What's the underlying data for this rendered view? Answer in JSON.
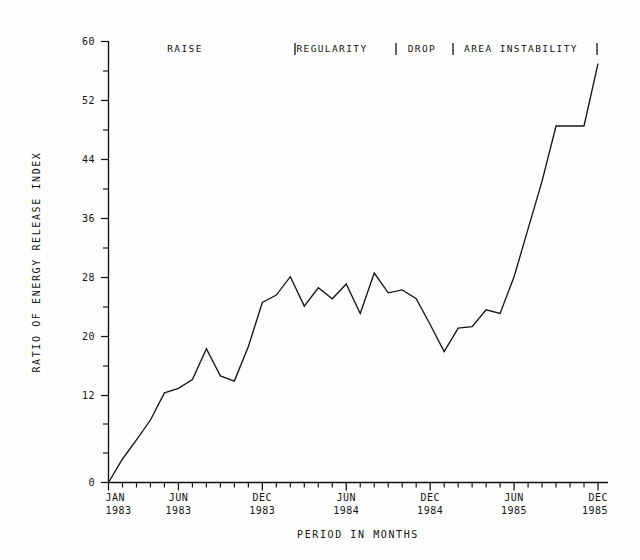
{
  "chart_data": {
    "type": "line",
    "title": "",
    "xlabel": "PERIOD IN MONTHS",
    "ylabel": "RATIO OF ENERGY RELEASE INDEX",
    "ylim": [
      0,
      60
    ],
    "y_major_ticks": [
      0,
      12,
      20,
      28,
      36,
      44,
      52,
      60
    ],
    "y_tick_labels": [
      "0",
      "12",
      "20",
      "28",
      "36",
      "44",
      "52",
      "60"
    ],
    "y_minor_ticks": [
      4,
      8,
      16,
      24,
      32,
      40,
      48,
      56
    ],
    "grid": false,
    "legend": "none",
    "x_tick_labels": [
      {
        "month": "JAN",
        "year": "1983",
        "index": 0
      },
      {
        "month": "JUN",
        "year": "1983",
        "index": 5
      },
      {
        "month": "DEC",
        "year": "1983",
        "index": 11
      },
      {
        "month": "JUN",
        "year": "1984",
        "index": 17
      },
      {
        "month": "DEC",
        "year": "1984",
        "index": 23
      },
      {
        "month": "JUN",
        "year": "1985",
        "index": 29
      },
      {
        "month": "DEC",
        "year": "1985",
        "index": 35
      }
    ],
    "x": [
      "JAN 1983",
      "FEB 1983",
      "MAR 1983",
      "APR 1983",
      "MAY 1983",
      "JUN 1983",
      "JUL 1983",
      "AUG 1983",
      "SEP 1983",
      "OCT 1983",
      "NOV 1983",
      "DEC 1983",
      "JAN 1984",
      "FEB 1984",
      "MAR 1984",
      "APR 1984",
      "MAY 1984",
      "JUN 1984",
      "JUL 1984",
      "AUG 1984",
      "SEP 1984",
      "OCT 1984",
      "NOV 1984",
      "DEC 1984",
      "JAN 1985",
      "FEB 1985",
      "MAR 1985",
      "APR 1985",
      "MAY 1985",
      "JUN 1985",
      "JUL 1985",
      "AUG 1985",
      "SEP 1985",
      "OCT 1985",
      "NOV 1985",
      "DEC 1985"
    ],
    "values": [
      0.0,
      3.2,
      5.8,
      8.5,
      12.2,
      12.8,
      14.0,
      18.2,
      14.5,
      13.8,
      18.5,
      24.5,
      25.5,
      28.0,
      24.0,
      26.5,
      25.0,
      27.0,
      23.0,
      28.5,
      25.8,
      26.2,
      25.0,
      21.5,
      17.8,
      21.0,
      21.2,
      23.5,
      23.0,
      28.0,
      34.5,
      41.0,
      48.5,
      48.5,
      48.5,
      57.0
    ],
    "annotations": [
      {
        "label": "RAISE",
        "x_px": 185
      },
      {
        "label": "REGULARITY",
        "x_px": 332
      },
      {
        "label": "DROP",
        "x_px": 422
      },
      {
        "label": "AREA INSTABILITY",
        "x_px": 521
      }
    ],
    "annotation_dividers_px": [
      295,
      396,
      453,
      597
    ]
  }
}
